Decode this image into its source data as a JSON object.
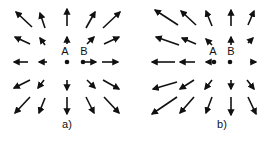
{
  "panels": [
    {
      "label": "a)",
      "label_pos": [
        67,
        128
      ],
      "points": [
        {
          "name": "A",
          "x": 67,
          "y": 62,
          "label_pos": [
            65,
            55
          ]
        },
        {
          "name": "B",
          "x": 83,
          "y": 62,
          "label_pos": [
            84,
            55
          ]
        }
      ],
      "arrows": [
        [
          32,
          27,
          16,
          12
        ],
        [
          45,
          28,
          40,
          13
        ],
        [
          67,
          26,
          67,
          9
        ],
        [
          86,
          28,
          95,
          12
        ],
        [
          103,
          28,
          120,
          12
        ],
        [
          30,
          44,
          15,
          37
        ],
        [
          45,
          45,
          40,
          38
        ],
        [
          67,
          44,
          67,
          37
        ],
        [
          87,
          44,
          94,
          37
        ],
        [
          104,
          44,
          119,
          37
        ],
        [
          28,
          62,
          14,
          62
        ],
        [
          47,
          62,
          39,
          62
        ],
        [
          84,
          62,
          96,
          62
        ],
        [
          102,
          62,
          118,
          62
        ],
        [
          30,
          80,
          14,
          88
        ],
        [
          44,
          80,
          38,
          88
        ],
        [
          67,
          80,
          67,
          90
        ],
        [
          87,
          80,
          95,
          88
        ],
        [
          103,
          80,
          119,
          89
        ],
        [
          30,
          97,
          15,
          113
        ],
        [
          45,
          98,
          39,
          113
        ],
        [
          67,
          97,
          67,
          114
        ],
        [
          86,
          97,
          94,
          113
        ],
        [
          104,
          97,
          119,
          113
        ]
      ]
    },
    {
      "label": "b)",
      "label_pos": [
        222,
        128
      ],
      "points": [
        {
          "name": "A",
          "x": 214,
          "y": 62,
          "label_pos": [
            213,
            55
          ]
        },
        {
          "name": "B",
          "x": 230,
          "y": 62,
          "label_pos": [
            231,
            55
          ]
        }
      ],
      "arrows": [
        [
          178,
          25,
          155,
          10
        ],
        [
          196,
          25,
          181,
          11
        ],
        [
          212,
          26,
          206,
          11
        ],
        [
          231,
          26,
          231,
          10
        ],
        [
          248,
          25,
          254,
          11
        ],
        [
          179,
          45,
          156,
          37
        ],
        [
          196,
          44,
          182,
          38
        ],
        [
          212,
          45,
          206,
          39
        ],
        [
          231,
          45,
          231,
          37
        ],
        [
          248,
          43,
          253,
          38
        ],
        [
          175,
          62,
          152,
          62
        ],
        [
          195,
          62,
          180,
          62
        ],
        [
          211,
          62,
          206,
          62
        ],
        [
          250,
          62,
          256,
          62
        ],
        [
          177,
          82,
          153,
          89
        ],
        [
          194,
          80,
          180,
          89
        ],
        [
          212,
          80,
          205,
          89
        ],
        [
          231,
          80,
          231,
          89
        ],
        [
          247,
          80,
          254,
          89
        ],
        [
          177,
          97,
          152,
          114
        ],
        [
          194,
          97,
          180,
          113
        ],
        [
          212,
          97,
          206,
          113
        ],
        [
          231,
          97,
          231,
          115
        ],
        [
          248,
          97,
          256,
          114
        ]
      ]
    }
  ]
}
